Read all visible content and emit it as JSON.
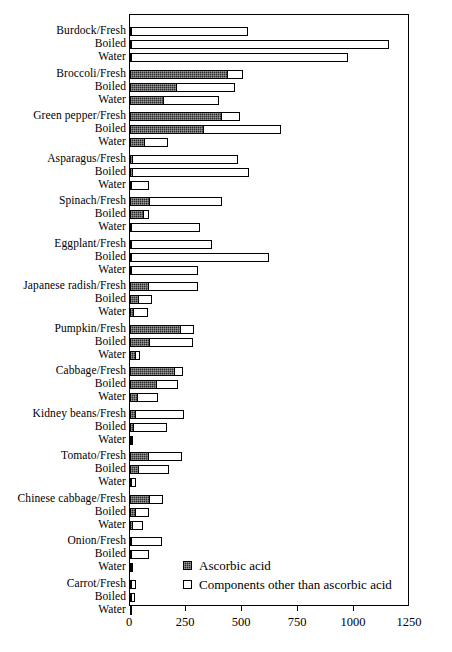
{
  "chart_data": {
    "type": "bar",
    "orientation": "horizontal",
    "stacked": true,
    "title": "",
    "xlabel": "",
    "ylabel": "",
    "xlim": [
      0,
      1250
    ],
    "xticks": [
      0,
      250,
      500,
      750,
      1000,
      1250
    ],
    "xtick_labels": [
      "0",
      "250",
      "500",
      "750",
      "1000",
      "1250"
    ],
    "grid": false,
    "legend_position": "inside-bottom-right",
    "series": [
      {
        "name": "Ascorbic acid",
        "style": "dark-hatched",
        "color": "#2b2b2b"
      },
      {
        "name": "Components other than ascorbic acid",
        "style": "white-outlined",
        "color": "#ffffff"
      }
    ],
    "sub_categories": [
      "Fresh",
      "Boiled",
      "Water"
    ],
    "groups": [
      {
        "vegetable": "Burdock",
        "rows": [
          {
            "label": "Burdock/Fresh",
            "ascorbic_acid": 8,
            "other_components": 523
          },
          {
            "label": "Boiled",
            "ascorbic_acid": 4,
            "other_components": 1152
          },
          {
            "label": "Water",
            "ascorbic_acid": 3,
            "other_components": 970
          }
        ]
      },
      {
        "vegetable": "Broccoli",
        "rows": [
          {
            "label": "Broccoli/Fresh",
            "ascorbic_acid": 436,
            "other_components": 73
          },
          {
            "label": "Boiled",
            "ascorbic_acid": 208,
            "other_components": 265
          },
          {
            "label": "Water",
            "ascorbic_acid": 150,
            "other_components": 252
          }
        ]
      },
      {
        "vegetable": "Green pepper",
        "rows": [
          {
            "label": "Green pepper/Fresh",
            "ascorbic_acid": 411,
            "other_components": 85
          },
          {
            "label": "Boiled",
            "ascorbic_acid": 332,
            "other_components": 347
          },
          {
            "label": "Water",
            "ascorbic_acid": 67,
            "other_components": 109
          }
        ]
      },
      {
        "vegetable": "Asparagus",
        "rows": [
          {
            "label": "Asparagus/Fresh",
            "ascorbic_acid": 15,
            "other_components": 473
          },
          {
            "label": "Boiled",
            "ascorbic_acid": 12,
            "other_components": 525
          },
          {
            "label": "Water",
            "ascorbic_acid": 5,
            "other_components": 79
          }
        ]
      },
      {
        "vegetable": "Spinach",
        "rows": [
          {
            "label": "Spinach/Fresh",
            "ascorbic_acid": 91,
            "other_components": 323
          },
          {
            "label": "Boiled",
            "ascorbic_acid": 64,
            "other_components": 25
          },
          {
            "label": "Water",
            "ascorbic_acid": 4,
            "other_components": 309
          }
        ]
      },
      {
        "vegetable": "Eggplant",
        "rows": [
          {
            "label": "Eggplant/Fresh",
            "ascorbic_acid": 6,
            "other_components": 363
          },
          {
            "label": "Boiled",
            "ascorbic_acid": 4,
            "other_components": 618
          },
          {
            "label": "Water",
            "ascorbic_acid": 3,
            "other_components": 299
          }
        ]
      },
      {
        "vegetable": "Japanese radish",
        "rows": [
          {
            "label": "Japanese radish/Fresh",
            "ascorbic_acid": 86,
            "other_components": 221
          },
          {
            "label": "Boiled",
            "ascorbic_acid": 42,
            "other_components": 62
          },
          {
            "label": "Water",
            "ascorbic_acid": 19,
            "other_components": 65
          }
        ]
      },
      {
        "vegetable": "Pumpkin",
        "rows": [
          {
            "label": "Pumpkin/Fresh",
            "ascorbic_acid": 228,
            "other_components": 64
          },
          {
            "label": "Boiled",
            "ascorbic_acid": 89,
            "other_components": 198
          },
          {
            "label": "Water",
            "ascorbic_acid": 27,
            "other_components": 22
          }
        ]
      },
      {
        "vegetable": "Cabbage",
        "rows": [
          {
            "label": "Cabbage/Fresh",
            "ascorbic_acid": 203,
            "other_components": 39
          },
          {
            "label": "Boiled",
            "ascorbic_acid": 121,
            "other_components": 96
          },
          {
            "label": "Water",
            "ascorbic_acid": 37,
            "other_components": 91
          }
        ]
      },
      {
        "vegetable": "Kidney beans",
        "rows": [
          {
            "label": "Kidney beans/Fresh",
            "ascorbic_acid": 27,
            "other_components": 220
          },
          {
            "label": "Boiled",
            "ascorbic_acid": 19,
            "other_components": 149
          },
          {
            "label": "Water",
            "ascorbic_acid": 4,
            "other_components": 8
          }
        ]
      },
      {
        "vegetable": "Tomato",
        "rows": [
          {
            "label": "Tomato/Fresh",
            "ascorbic_acid": 84,
            "other_components": 154
          },
          {
            "label": "Boiled",
            "ascorbic_acid": 42,
            "other_components": 138
          },
          {
            "label": "Water",
            "ascorbic_acid": 7,
            "other_components": 23
          }
        ]
      },
      {
        "vegetable": "Chinese cabbage",
        "rows": [
          {
            "label": "Chinese cabbage/Fresh",
            "ascorbic_acid": 91,
            "other_components": 59
          },
          {
            "label": "Boiled",
            "ascorbic_acid": 27,
            "other_components": 62
          },
          {
            "label": "Water",
            "ascorbic_acid": 15,
            "other_components": 49
          }
        ]
      },
      {
        "vegetable": "Onion",
        "rows": [
          {
            "label": "Onion/Fresh",
            "ascorbic_acid": 6,
            "other_components": 137
          },
          {
            "label": "Boiled",
            "ascorbic_acid": 4,
            "other_components": 82
          },
          {
            "label": "Water",
            "ascorbic_acid": 2,
            "other_components": 8
          }
        ]
      },
      {
        "vegetable": "Carrot",
        "rows": [
          {
            "label": "Carrot/Fresh",
            "ascorbic_acid": 3,
            "other_components": 24
          },
          {
            "label": "Boiled",
            "ascorbic_acid": 2,
            "other_components": 17
          },
          {
            "label": "Water",
            "ascorbic_acid": 1,
            "other_components": 11
          }
        ]
      }
    ]
  },
  "legend": {
    "items": [
      {
        "label": "Ascorbic acid",
        "swatch": "dark"
      },
      {
        "label": "Components other than ascorbic acid",
        "swatch": "light"
      }
    ]
  }
}
